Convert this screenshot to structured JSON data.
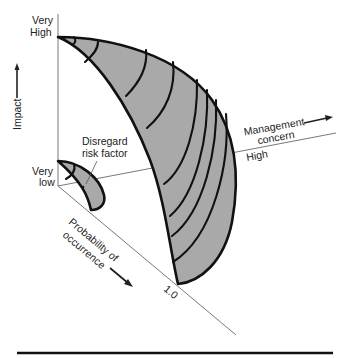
{
  "diagram": {
    "type": "3d-risk-surface",
    "axes": {
      "impact": {
        "label": "Impact",
        "high_label_line1": "Very",
        "high_label_line2": "High",
        "low_label_line1": "Very",
        "low_label_line2": "low"
      },
      "management_concern": {
        "label_line1": "Management",
        "label_line2": "concern",
        "end_label": "High"
      },
      "probability": {
        "label_line1": "Probability of",
        "label_line2": "occurrence",
        "end_label": "1.0"
      }
    },
    "annotation": {
      "line1": "Disregard",
      "line2": "risk factor"
    },
    "colors": {
      "fill": "#a9a9a9",
      "stroke": "#111111",
      "axis": "#555555",
      "background": "#ffffff"
    },
    "main_surface_contours": 9,
    "small_surface_contours": 1
  }
}
